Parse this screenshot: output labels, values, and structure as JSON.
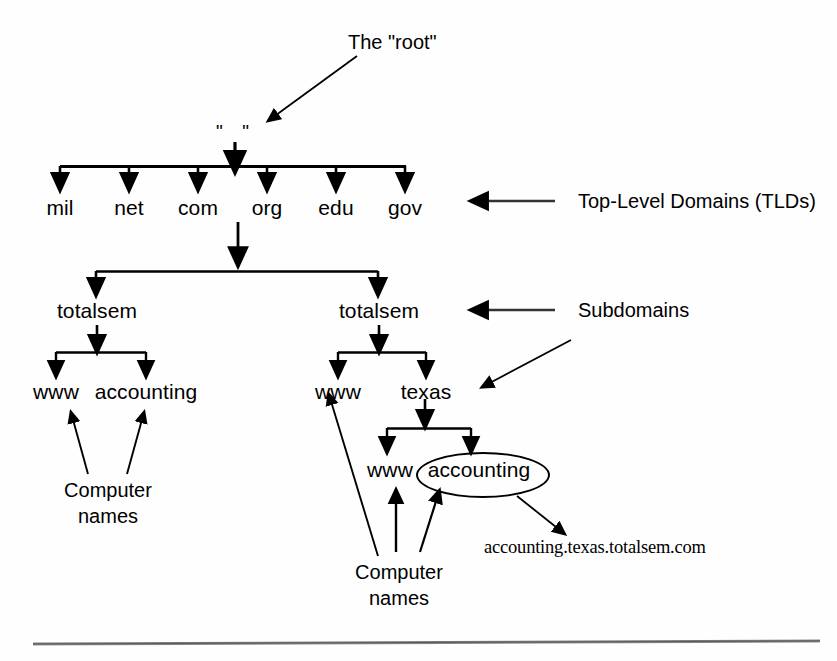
{
  "diagram": {
    "title_note": "The \"root\"",
    "root_label": "\" \"",
    "tlds": [
      {
        "label": "mil"
      },
      {
        "label": "net"
      },
      {
        "label": "com"
      },
      {
        "label": "org"
      },
      {
        "label": "edu"
      },
      {
        "label": "gov"
      }
    ],
    "annotations": {
      "tld": "Top-Level Domains (TLDs)",
      "subdomains": "Subdomains",
      "computer_names_left": "Computer\nnames",
      "computer_names_left_line1": "Computer",
      "computer_names_left_line2": "names",
      "computer_names_right_line1": "Computer",
      "computer_names_right_line2": "names"
    },
    "left_branch": {
      "subdomain": "totalsem",
      "hosts": [
        "www",
        "accounting"
      ]
    },
    "right_branch": {
      "subdomain": "totalsem",
      "hosts": [
        "www",
        "texas"
      ],
      "texas_children": [
        "www",
        "accounting"
      ],
      "highlighted_host": "accounting"
    },
    "fqdn": "accounting.texas.totalsem.com",
    "colors": {
      "ink": "#000000",
      "paper": "#fefefe",
      "rule": "#6b6b6b"
    }
  }
}
